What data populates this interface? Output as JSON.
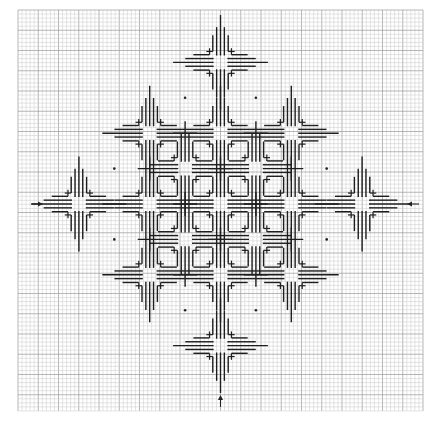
{
  "colors": {
    "background": "#ffffff",
    "grid_minor": "#c8c8c8",
    "grid_major": "#9a9a9a",
    "stitch": "#1e1e1e",
    "marker": "#222222"
  },
  "grid": {
    "columns": 100,
    "rows": 99
  },
  "motif": {
    "name": "four-point star",
    "center_blank_cells": 3,
    "arm_stitch_lengths_cells": [
      4,
      7,
      10,
      7,
      4
    ]
  },
  "stars": {
    "lattice_offsets": [
      [
        0,
        -4
      ],
      [
        -2,
        -2
      ],
      [
        0,
        -2
      ],
      [
        2,
        -2
      ],
      [
        -1,
        -1
      ],
      [
        1,
        -1
      ],
      [
        -4,
        0
      ],
      [
        -2,
        0
      ],
      [
        0,
        0
      ],
      [
        2,
        0
      ],
      [
        4,
        0
      ],
      [
        -1,
        1
      ],
      [
        1,
        1
      ],
      [
        -2,
        2
      ],
      [
        0,
        2
      ],
      [
        2,
        2
      ],
      [
        0,
        4
      ]
    ]
  },
  "markers": {
    "arrows": [
      {
        "direction": "right",
        "position": "left-middle"
      },
      {
        "direction": "left",
        "position": "right-middle"
      },
      {
        "direction": "up",
        "position": "bottom-center"
      }
    ],
    "dot_count": 8
  }
}
